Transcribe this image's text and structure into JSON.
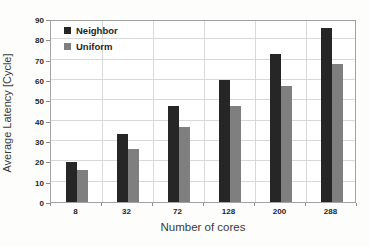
{
  "chart_data": {
    "type": "bar",
    "title": "",
    "categories": [
      "8",
      "32",
      "72",
      "128",
      "200",
      "288"
    ],
    "series": [
      {
        "name": "Neighbor",
        "color": "#262626",
        "values": [
          19.5,
          33.5,
          47,
          60,
          73,
          85.5
        ]
      },
      {
        "name": "Uniform",
        "color": "#7f7f7f",
        "values": [
          15.5,
          26,
          37,
          47,
          57,
          68
        ]
      }
    ],
    "xlabel": "Number of cores",
    "ylabel": "Average Latency [Cycle]",
    "ylim": [
      0,
      90
    ],
    "ytick_step": 10,
    "yticks": [
      "0",
      "10",
      "20",
      "30",
      "40",
      "50",
      "60",
      "70",
      "80",
      "90"
    ],
    "grid": true,
    "legend_position": "top-left-inside"
  },
  "colors": {
    "neighbor_bar": "#262626",
    "uniform_bar": "#7f7f7f",
    "gridline": "#d8d8d8",
    "plot_border": "#a3a3a3",
    "tick_text": "#1f1f1f",
    "title_text": "#3a3a3a",
    "background": "#fdfdfc"
  }
}
